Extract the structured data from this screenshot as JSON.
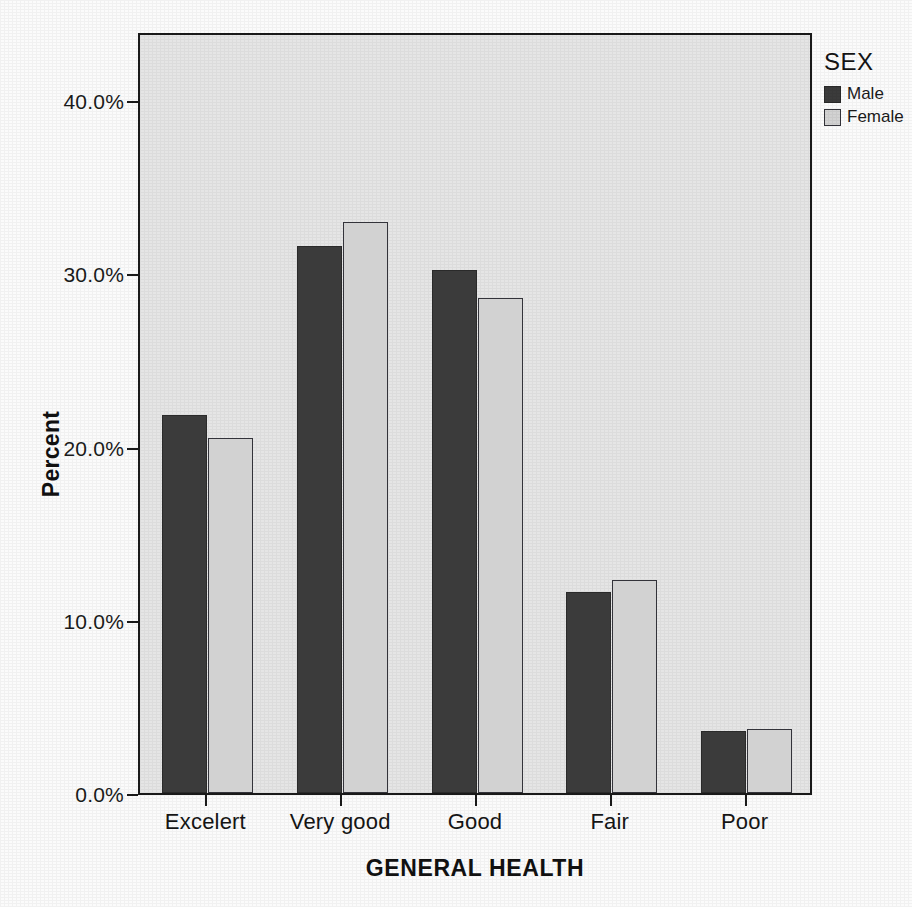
{
  "chart_data": {
    "type": "bar",
    "title": "",
    "xlabel": "GENERAL HEALTH",
    "ylabel": "Percent",
    "categories": [
      "Excelert",
      "Very good",
      "Good",
      "Fair",
      "Poor"
    ],
    "series": [
      {
        "name": "Male",
        "color": "#3b3b3b",
        "values": [
          21.8,
          31.6,
          30.2,
          11.6,
          3.6
        ]
      },
      {
        "name": "Female",
        "color": "#d2d2d2",
        "values": [
          20.5,
          33.0,
          28.6,
          12.3,
          3.7
        ]
      }
    ],
    "ylim": [
      0,
      44.0
    ],
    "yticks": [
      0,
      10,
      20,
      30,
      40
    ],
    "ytick_labels": [
      "0.0%",
      "10.0%",
      "20.0%",
      "30.0%",
      "40.0%"
    ],
    "grid": false,
    "legend": {
      "title": "SEX",
      "position": "right-top",
      "entries": [
        "Male",
        "Female"
      ]
    }
  },
  "axes": {
    "y_title": "Percent",
    "x_title": "GENERAL HEALTH"
  },
  "legend": {
    "title": "SEX",
    "items": [
      {
        "label": "Male",
        "swatch": "male-swatch"
      },
      {
        "label": "Female",
        "swatch": "female-swatch"
      }
    ]
  },
  "colors": {
    "male": "#3b3b3b",
    "female": "#d2d2d2",
    "plot_background": "#e5e5e5",
    "page_background": "#fbfbfb",
    "axis": "#1a1a1a"
  }
}
